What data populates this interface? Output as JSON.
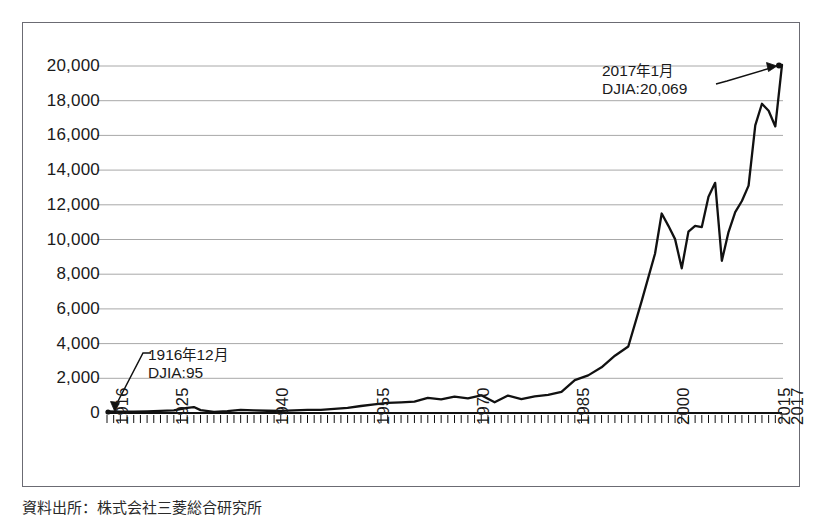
{
  "figure": {
    "border_color": "#6b6b73",
    "background": "#ffffff",
    "gridline_color": "#a8a8a8",
    "line_color": "#111111",
    "caption": "資料出所：株式会社三菱総合研究所"
  },
  "annotations": {
    "start": {
      "line1_year": "1916",
      "line1_nen": "年",
      "line1_month": "12",
      "line1_getsu": "月",
      "line2": "DJIA:95"
    },
    "end": {
      "line1_year": "2017",
      "line1_nen": "年",
      "line1_month": "1",
      "line1_getsu": "月",
      "line2": "DJIA:20,069"
    }
  },
  "chart_data": {
    "type": "line",
    "title": "",
    "xlabel": "",
    "ylabel": "",
    "grid": true,
    "legend": "none",
    "xlim": [
      1916,
      2017
    ],
    "ylim": [
      0,
      21000
    ],
    "ytick_labels": [
      "20,000",
      "18,000",
      "16,000",
      "14,000",
      "12,000",
      "10,000",
      "8,000",
      "6,000",
      "4,000",
      "2,000",
      "0"
    ],
    "ytick_values": [
      20000,
      18000,
      16000,
      14000,
      12000,
      10000,
      8000,
      6000,
      4000,
      2000,
      0
    ],
    "xtick_labels": [
      "1916",
      "1925",
      "1940",
      "1955",
      "1970",
      "1985",
      "2000",
      "2015",
      "2017"
    ],
    "xtick_values": [
      1916,
      1925,
      1940,
      1955,
      1970,
      1985,
      2000,
      2015,
      2017
    ],
    "minor_tick_interval": 1,
    "series": [
      {
        "name": "DJIA",
        "x": [
          1916,
          1918,
          1920,
          1922,
          1924,
          1926,
          1928,
          1929,
          1930,
          1932,
          1934,
          1936,
          1938,
          1940,
          1942,
          1944,
          1946,
          1948,
          1950,
          1952,
          1954,
          1956,
          1958,
          1960,
          1962,
          1964,
          1966,
          1968,
          1970,
          1972,
          1974,
          1976,
          1978,
          1980,
          1982,
          1984,
          1986,
          1988,
          1990,
          1992,
          1994,
          1996,
          1998,
          1999,
          2000,
          2001,
          2002,
          2003,
          2004,
          2005,
          2006,
          2007,
          2008,
          2009,
          2010,
          2011,
          2012,
          2013,
          2014,
          2015,
          2016,
          2017
        ],
        "y": [
          95,
          82,
          72,
          98,
          120,
          157,
          300,
          343,
          165,
          60,
          104,
          180,
          155,
          131,
          119,
          152,
          177,
          177,
          235,
          292,
          404,
          499,
          584,
          616,
          652,
          874,
          786,
          944,
          839,
          1020,
          616,
          1005,
          805,
          964,
          1047,
          1212,
          1896,
          2169,
          2634,
          3301,
          3834,
          6448,
          9181,
          11497,
          10787,
          10022,
          8342,
          10454,
          10783,
          10718,
          12463,
          13265,
          8776,
          10428,
          11578,
          12218,
          13104,
          16577,
          17823,
          17425,
          16517,
          20069
        ]
      }
    ],
    "point_annotations": [
      {
        "x": 1916,
        "y": 95,
        "label": "1916 年 12 月 / DJIA:95"
      },
      {
        "x": 2017,
        "y": 20069,
        "label": "2017 年 1 月 / DJIA:20,069"
      }
    ]
  }
}
